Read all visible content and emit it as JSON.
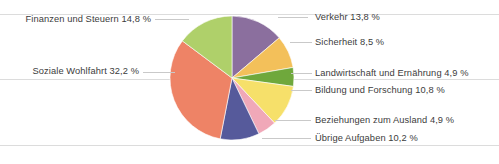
{
  "chart_data": {
    "type": "pie",
    "title": "",
    "subtitle": "",
    "xlabel": "",
    "ylabel": "",
    "legend_position": "callout-labels",
    "grid": false,
    "unit": "%",
    "start_angle_deg": 0,
    "direction": "clockwise",
    "categories": [
      "Verkehr",
      "Sicherheit",
      "Landwirtschaft und Ernährung",
      "Bildung und Forschung",
      "Beziehungen zum Ausland",
      "Übrige Aufgaben",
      "Soziale Wohlfahrt",
      "Finanzen und Steuern"
    ],
    "values": [
      13.8,
      8.5,
      4.9,
      10.8,
      4.9,
      10.2,
      32.2,
      14.8
    ],
    "colors": [
      "#8B6F9E",
      "#F3C05A",
      "#6FA83C",
      "#F6E06A",
      "#F0A8B8",
      "#565A9B",
      "#EE8366",
      "#AFD06A"
    ],
    "slices": [
      {
        "label": "Verkehr 13,8 %",
        "name": "Verkehr",
        "value": 13.8,
        "color": "#8B6F9E"
      },
      {
        "label": "Sicherheit 8,5 %",
        "name": "Sicherheit",
        "value": 8.5,
        "color": "#F3C05A"
      },
      {
        "label": "Landwirtschaft und Ernährung 4,9 %",
        "name": "Landwirtschaft und Ernährung",
        "value": 4.9,
        "color": "#6FA83C"
      },
      {
        "label": "Bildung und Forschung 10,8 %",
        "name": "Bildung und Forschung",
        "value": 10.8,
        "color": "#F6E06A"
      },
      {
        "label": "Beziehungen zum Ausland 4,9 %",
        "name": "Beziehungen zum Ausland",
        "value": 4.9,
        "color": "#F0A8B8"
      },
      {
        "label": "Übrige Aufgaben 10,2 %",
        "name": "Übrige Aufgaben",
        "value": 10.2,
        "color": "#565A9B"
      },
      {
        "label": "Soziale Wohlfahrt 32,2 %",
        "name": "Soziale Wohlfahrt",
        "value": 32.2,
        "color": "#EE8366"
      },
      {
        "label": "Finanzen und Steuern 14,8 %",
        "name": "Finanzen und Steuern",
        "value": 14.8,
        "color": "#AFD06A"
      }
    ]
  },
  "labels": {
    "finanzen": "Finanzen und Steuern 14,8 %",
    "soziale": "Soziale Wohlfahrt 32,2 %",
    "verkehr": "Verkehr 13,8 %",
    "sicherheit": "Sicherheit 8,5 %",
    "landwirtschaft": "Landwirtschaft und Ernährung 4,9 %",
    "bildung": "Bildung und Forschung 10,8 %",
    "beziehungen": "Beziehungen zum Ausland 4,9 %",
    "uebrige": "Übrige Aufgaben 10,2 %"
  }
}
